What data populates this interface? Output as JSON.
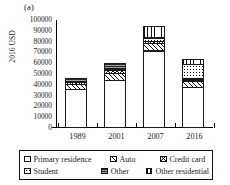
{
  "panel": {
    "letter": "(a)"
  },
  "axes": {
    "ylabel": "2016 USD",
    "yticks": [
      "0",
      "10000",
      "20000",
      "30000",
      "40000",
      "50000",
      "60000",
      "70000",
      "80000",
      "90000",
      "100000"
    ],
    "xticks": [
      "1989",
      "2001",
      "2007",
      "2016"
    ]
  },
  "legend": {
    "rows": [
      [
        {
          "label": "Primary residence",
          "pattern": "p-primary"
        },
        {
          "label": "Auto",
          "pattern": "p-auto"
        },
        {
          "label": "Credit card",
          "pattern": "p-credit"
        }
      ],
      [
        {
          "label": "Student",
          "pattern": "p-student"
        },
        {
          "label": "Other",
          "pattern": "p-other"
        },
        {
          "label": "Other residential",
          "pattern": "p-otherres"
        }
      ]
    ]
  },
  "chart_data": {
    "type": "bar",
    "title": "",
    "subtitle": "",
    "xlabel": "",
    "ylabel": "2016 USD",
    "ylim": [
      0,
      100000
    ],
    "ytick_step": 10000,
    "grid": false,
    "stacked": true,
    "legend_position": "below",
    "categories": [
      "1989",
      "2001",
      "2007",
      "2016"
    ],
    "series": [
      {
        "name": "Primary residence",
        "pattern": "p-primary",
        "values": [
          36000,
          44000,
          71500,
          38000
        ]
      },
      {
        "name": "Auto",
        "pattern": "p-auto",
        "values": [
          5500,
          7500,
          7500,
          6500
        ]
      },
      {
        "name": "Credit card",
        "pattern": "p-credit",
        "values": [
          2000,
          3500,
          3000,
          2500
        ]
      },
      {
        "name": "Student",
        "pattern": "p-student",
        "values": [
          500,
          2000,
          3500,
          14000
        ]
      },
      {
        "name": "Other",
        "pattern": "p-other",
        "values": [
          3500,
          5500,
          0,
          0
        ]
      },
      {
        "name": "Other residential",
        "pattern": "p-otherres",
        "values": [
          0,
          0,
          11500,
          5500
        ]
      }
    ],
    "totals": [
      47500,
      62500,
      97000,
      66500
    ]
  }
}
